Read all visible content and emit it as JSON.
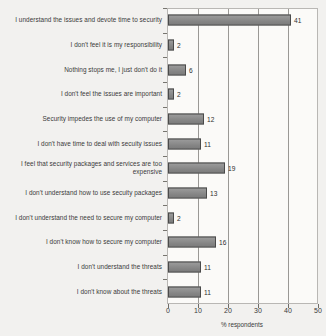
{
  "chart_data": {
    "type": "bar",
    "orientation": "horizontal",
    "title": "",
    "xlabel": "% respondents",
    "ylabel": "",
    "xlim": [
      0,
      50
    ],
    "xticks": [
      0,
      10,
      20,
      30,
      40,
      50
    ],
    "grid": true,
    "legend": false,
    "bar_color": "#8d8d8d",
    "bar_edge_color": "#4a4a4a",
    "background_color": "#fbfaf8",
    "categories": [
      "I understand the issues and devote time to security",
      "I don't feel it is my responsibility",
      "Nothing stops me, I just don't do it",
      "I don't feel the issues are important",
      "Security impedes the use of my computer",
      "I don't have time to deal with secuity issues",
      "I feel that security packages and services are too expensive",
      "I don't understand how to use secuity packages",
      "I don't understand the need to secure my computer",
      "I don't know how to secure my computer",
      "I don't understand the threats",
      "I don't know about the threats"
    ],
    "values": [
      41,
      2,
      6,
      2,
      12,
      11,
      19,
      13,
      2,
      16,
      11,
      11
    ],
    "value_labels": [
      "41",
      "2",
      "6",
      "2",
      "12",
      "11",
      "19",
      "13",
      "2",
      "16",
      "11",
      "11"
    ]
  }
}
